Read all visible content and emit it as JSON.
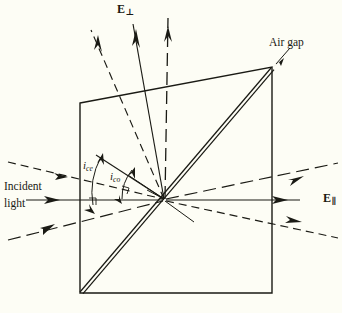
{
  "figure": {
    "background_color": "#fdfdf5",
    "ink_color": "#1a1a14"
  },
  "labels": {
    "air_gap": "Air gap",
    "incident_line1": "Incident",
    "incident_line2": "light",
    "e_perp_symbol": "E",
    "e_perp_subscript": "⊥",
    "e_par_symbol": "E",
    "e_par_subscript": "∥",
    "angle_ce_symbol": "i",
    "angle_ce_subscript": "ce",
    "angle_co_symbol": "i",
    "angle_co_subscript": "co"
  },
  "geometry": {
    "crystal_corners": {
      "top_left": [
        80,
        103
      ],
      "top_right": [
        272,
        67
      ],
      "bottom_right": [
        272,
        293
      ],
      "bottom_left": [
        80,
        293
      ]
    },
    "air_gap_line": {
      "from": [
        80,
        292
      ],
      "to": [
        271,
        68
      ],
      "style": "double-line"
    },
    "ray_convergence_point": [
      165,
      200
    ]
  },
  "rays": {
    "incoming": [
      {
        "name": "extraordinary-in",
        "style": "dashed-short",
        "from": [
          8,
          163
        ],
        "to": [
          165,
          200
        ]
      },
      {
        "name": "incident-main",
        "style": "solid",
        "from": [
          26,
          200
        ],
        "to": [
          165,
          200
        ]
      },
      {
        "name": "ordinary-in",
        "style": "dashed-long",
        "from": [
          8,
          240
        ],
        "to": [
          165,
          200
        ]
      }
    ],
    "outgoing_up": [
      {
        "name": "e-perp-extraordinary-up",
        "style": "dashed-short",
        "from": [
          165,
          200
        ],
        "to": [
          91,
          27
        ]
      },
      {
        "name": "e-perp-main-up",
        "style": "solid",
        "from": [
          165,
          200
        ],
        "to": [
          133,
          22
        ]
      },
      {
        "name": "e-perp-ordinary-up",
        "style": "dashed-long",
        "from": [
          165,
          200
        ],
        "to": [
          168,
          16
        ]
      }
    ],
    "outgoing_right": [
      {
        "name": "e-par-ordinary-out",
        "style": "dashed-long",
        "from": [
          165,
          200
        ],
        "to": [
          338,
          163
        ]
      },
      {
        "name": "e-par-main-out",
        "style": "solid",
        "from": [
          165,
          200
        ],
        "to": [
          300,
          200
        ]
      },
      {
        "name": "e-par-extraordinary-out",
        "style": "dashed-short",
        "from": [
          165,
          200
        ],
        "to": [
          338,
          238
        ]
      }
    ],
    "construction": [
      {
        "name": "normal-ce-line",
        "from": [
          165,
          200
        ],
        "to": [
          96,
          156
        ]
      },
      {
        "name": "normal-co-line",
        "from": [
          165,
          200
        ],
        "to": [
          128,
          175
        ]
      },
      {
        "name": "lower-right-stub",
        "from": [
          165,
          200
        ],
        "to": [
          193,
          221
        ]
      },
      {
        "name": "upper-left-stub",
        "from": [
          165,
          200
        ],
        "to": [
          150,
          192
        ]
      }
    ]
  },
  "angle_arcs": [
    {
      "name": "arc-i-ce",
      "radius": 72,
      "from_deg": 180,
      "to_deg": 212
    },
    {
      "name": "arc-i-co",
      "radius": 44,
      "from_deg": 180,
      "to_deg": 207
    }
  ]
}
